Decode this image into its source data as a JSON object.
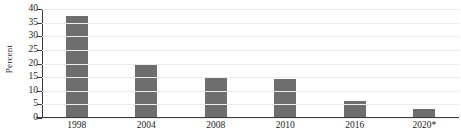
{
  "chart_data": {
    "type": "bar",
    "title": "",
    "xlabel": "",
    "ylabel": "Percent",
    "categories": [
      "1998",
      "2004",
      "2008",
      "2010",
      "2016",
      "2020*"
    ],
    "values": [
      37.5,
      19.5,
      14.5,
      14.2,
      6.0,
      3.0
    ],
    "ylim": [
      0,
      40
    ],
    "yticks": [
      0,
      5,
      10,
      15,
      20,
      25,
      30,
      35,
      40
    ],
    "ytick_labels": [
      "0",
      "5",
      "10",
      "15",
      "20",
      "25",
      "30",
      "35",
      "40"
    ],
    "grid": true,
    "legend": false,
    "bar_color": "#6e6e6e",
    "axis_color": "#3a3a3a",
    "grid_color": "#ececec"
  }
}
